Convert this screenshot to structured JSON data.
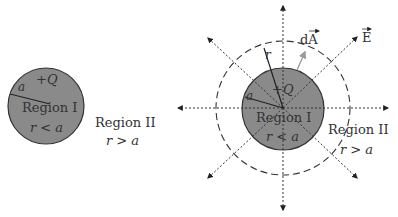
{
  "left_figure": {
    "charge_label": "+Q",
    "radius_label": "a",
    "inner_region_label": "Region I",
    "inner_condition": "r < a",
    "outer_region_label": "Region II",
    "outer_condition": "r > a"
  },
  "right_figure": {
    "charge_label": "+Q",
    "radius_label": "a",
    "gaussian_radius_label": "r",
    "area_vector_label": "dA",
    "field_label": "E",
    "inner_region_label": "Region I",
    "inner_condition": "r < a",
    "outer_region_label": "Region II",
    "outer_condition": "r > a"
  },
  "colors": {
    "sphere_fill": "#8a8a8a",
    "sphere_stroke": "#333333",
    "line": "#333333",
    "area_vector": "#9a9a9a"
  }
}
